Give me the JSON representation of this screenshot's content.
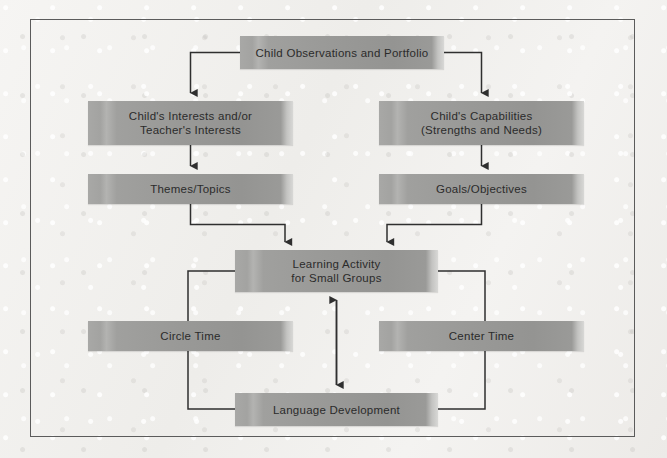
{
  "diagram": {
    "frame": {
      "visible": true,
      "border_color": "#5b5b5b"
    },
    "palette": {
      "box_fill_light": "#b3b3b1",
      "box_fill_dark": "#949492",
      "box_highlight": "#d8d8d6",
      "text_color": "#2b2b2b",
      "connector_color": "#2f2f2f",
      "background": "#f3f2f0"
    },
    "nodes": [
      {
        "id": "observations",
        "label": "Child Observations and Portfolio"
      },
      {
        "id": "interests",
        "label": "Child's Interests and/or\nTeacher's Interests"
      },
      {
        "id": "capabilities",
        "label": "Child's Capabilities\n(Strengths and Needs)"
      },
      {
        "id": "themes",
        "label": "Themes/Topics"
      },
      {
        "id": "goals",
        "label": "Goals/Objectives"
      },
      {
        "id": "learning",
        "label": "Learning Activity\nfor Small Groups"
      },
      {
        "id": "circle",
        "label": "Circle Time"
      },
      {
        "id": "center",
        "label": "Center Time"
      },
      {
        "id": "language",
        "label": "Language Development"
      }
    ],
    "edges": [
      {
        "from": "observations",
        "to": "interests",
        "type": "elbow",
        "arrow": "single"
      },
      {
        "from": "observations",
        "to": "capabilities",
        "type": "elbow",
        "arrow": "single"
      },
      {
        "from": "interests",
        "to": "themes",
        "type": "straight",
        "arrow": "single"
      },
      {
        "from": "capabilities",
        "to": "goals",
        "type": "straight",
        "arrow": "single"
      },
      {
        "from": "themes",
        "to": "learning",
        "type": "elbow",
        "arrow": "single"
      },
      {
        "from": "goals",
        "to": "learning",
        "type": "elbow",
        "arrow": "single"
      },
      {
        "from": "learning",
        "to": "language",
        "type": "straight",
        "arrow": "double"
      },
      {
        "from": "learning",
        "to": "circle",
        "type": "elbow-left",
        "arrow": "none"
      },
      {
        "from": "learning",
        "to": "center",
        "type": "elbow-right",
        "arrow": "none"
      },
      {
        "from": "circle",
        "to": "language",
        "type": "elbow-left",
        "arrow": "none"
      },
      {
        "from": "center",
        "to": "language",
        "type": "elbow-right",
        "arrow": "none"
      }
    ]
  }
}
